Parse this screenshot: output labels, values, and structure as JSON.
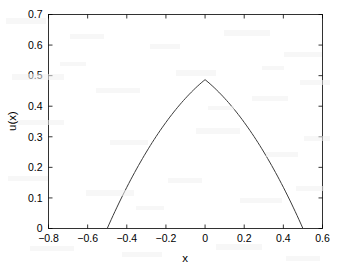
{
  "chart_data": {
    "type": "line",
    "title": "",
    "xlabel": "x",
    "ylabel": "u(x)",
    "xlim": [
      -0.8,
      0.6
    ],
    "ylim": [
      0,
      0.7
    ],
    "xticks": [
      -0.8,
      -0.6,
      -0.4,
      -0.2,
      0,
      0.2,
      0.4,
      0.6
    ],
    "xtick_labels": [
      "-0.8",
      "-0.6",
      "-0.4",
      "-0.2",
      "0",
      "0.2",
      "0.4",
      "0.6"
    ],
    "yticks": [
      0,
      0.1,
      0.2,
      0.3,
      0.4,
      0.5,
      0.6,
      0.7
    ],
    "ytick_labels": [
      "0",
      "0.1",
      "0.2",
      "0.3",
      "0.4",
      "0.5",
      "0.6",
      "0.7"
    ],
    "grid": false,
    "legend": null,
    "box": true,
    "series": [
      {
        "name": "u(x)",
        "color": "#3b3b3b",
        "peak_x": 0.0,
        "peak_y": 0.693,
        "zero_crossings": [
          -0.5,
          0.5
        ],
        "x": [
          -0.5,
          -0.49,
          -0.48,
          -0.47,
          -0.46,
          -0.45,
          -0.44,
          -0.43,
          -0.42,
          -0.41,
          -0.4,
          -0.39,
          -0.38,
          -0.37,
          -0.36,
          -0.35,
          -0.34,
          -0.33,
          -0.32,
          -0.31,
          -0.3,
          -0.29,
          -0.28,
          -0.27,
          -0.26,
          -0.25,
          -0.24,
          -0.23,
          -0.22,
          -0.21,
          -0.2,
          -0.19,
          -0.18,
          -0.17,
          -0.16,
          -0.15,
          -0.14,
          -0.13,
          -0.12,
          -0.11,
          -0.1,
          -0.09,
          -0.08,
          -0.07,
          -0.06,
          -0.05,
          -0.04,
          -0.03,
          -0.02,
          -0.01,
          0.0,
          0.01,
          0.02,
          0.03,
          0.04,
          0.05,
          0.06,
          0.07,
          0.08,
          0.09,
          0.1,
          0.11,
          0.12,
          0.13,
          0.14,
          0.15,
          0.16,
          0.17,
          0.18,
          0.19,
          0.2,
          0.21,
          0.22,
          0.23,
          0.24,
          0.25,
          0.26,
          0.27,
          0.28,
          0.29,
          0.3,
          0.31,
          0.32,
          0.33,
          0.34,
          0.35,
          0.36,
          0.37,
          0.38,
          0.39,
          0.4,
          0.41,
          0.42,
          0.43,
          0.44,
          0.45,
          0.46,
          0.47,
          0.48,
          0.49,
          0.5
        ],
        "y": [
          0.0,
          0.0144,
          0.0286,
          0.0426,
          0.0563,
          0.0699,
          0.0833,
          0.0964,
          0.1094,
          0.1222,
          0.1348,
          0.1472,
          0.1594,
          0.1714,
          0.1832,
          0.1948,
          0.2063,
          0.2175,
          0.2286,
          0.2395,
          0.2502,
          0.2607,
          0.2711,
          0.2812,
          0.2912,
          0.301,
          0.3106,
          0.32,
          0.3292,
          0.3383,
          0.3472,
          0.3559,
          0.3644,
          0.3727,
          0.3809,
          0.3888,
          0.3966,
          0.4042,
          0.4117,
          0.4189,
          0.426,
          0.4329,
          0.4396,
          0.4461,
          0.4525,
          0.4587,
          0.4647,
          0.4705,
          0.4762,
          0.4816,
          0.4869,
          0.4816,
          0.4762,
          0.4705,
          0.4647,
          0.4587,
          0.4525,
          0.4461,
          0.4396,
          0.4329,
          0.426,
          0.4189,
          0.4117,
          0.4042,
          0.3966,
          0.3888,
          0.3809,
          0.3727,
          0.3644,
          0.3559,
          0.3472,
          0.3383,
          0.3292,
          0.32,
          0.3106,
          0.301,
          0.2912,
          0.2812,
          0.2711,
          0.2607,
          0.2502,
          0.2395,
          0.2286,
          0.2175,
          0.2063,
          0.1948,
          0.1832,
          0.1714,
          0.1594,
          0.1472,
          0.1348,
          0.1222,
          0.1094,
          0.0964,
          0.0833,
          0.0699,
          0.0563,
          0.0426,
          0.0286,
          0.0144,
          0.0
        ]
      }
    ]
  }
}
